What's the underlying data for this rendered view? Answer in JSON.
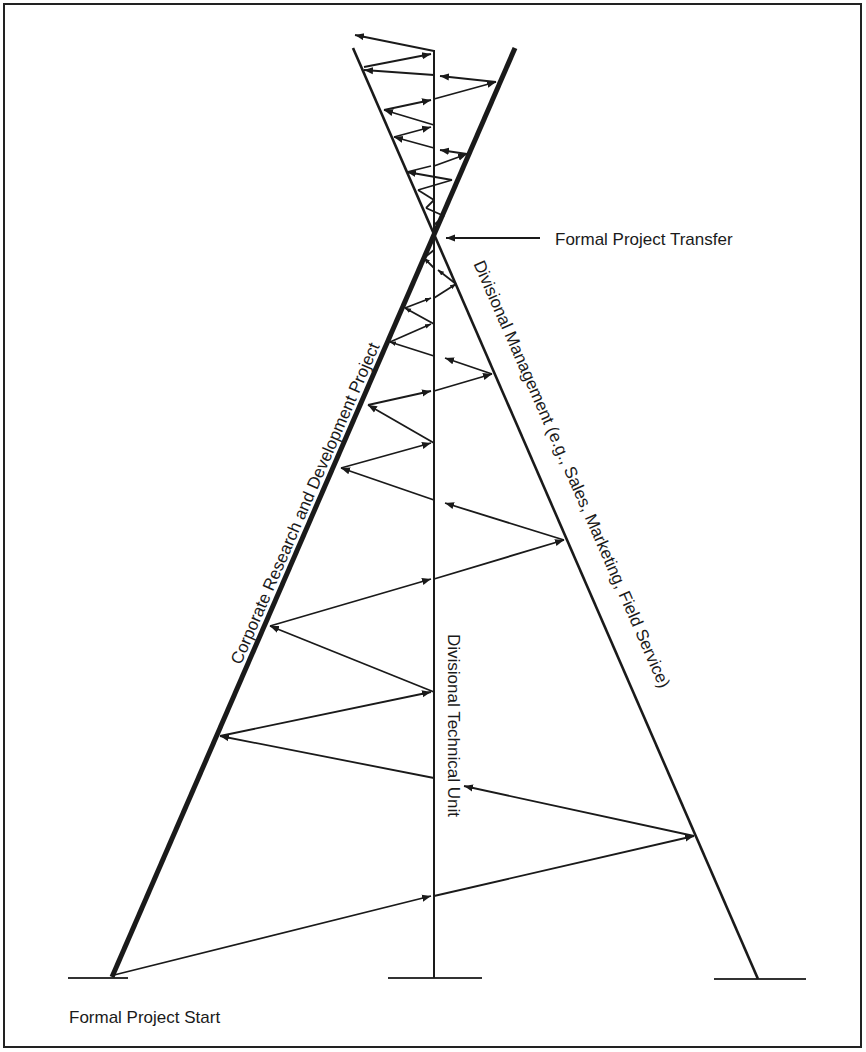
{
  "labels": {
    "formal_project_transfer": "Formal Project Transfer",
    "formal_project_start": "Formal Project Start",
    "corporate_rd": "Corporate Research and Development Project",
    "divisional_technical": "Divisional Technical Unit",
    "divisional_management": "Divisional Management (e.g., Sales, Marketing, Field Service)"
  },
  "colors": {
    "line": "#1a1a1a",
    "background": "#ffffff"
  },
  "structure": {
    "crossing_point": [
      435,
      232
    ],
    "corporate_line": {
      "from": [
        112,
        976
      ],
      "to": [
        515,
        48
      ],
      "weight": "thick"
    },
    "management_line": {
      "from": [
        758,
        978
      ],
      "to": [
        353,
        48
      ],
      "weight": "thin"
    },
    "technical_line": {
      "from": [
        434,
        50
      ],
      "to": [
        434,
        978
      ],
      "weight": "thin"
    }
  }
}
